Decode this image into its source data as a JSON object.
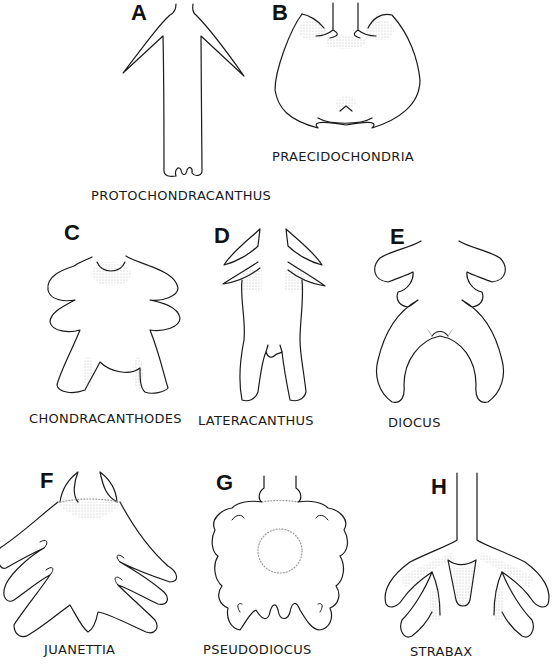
{
  "figure": {
    "panels": [
      {
        "letter": "A",
        "name": "PROTOCHONDRACANTHUS"
      },
      {
        "letter": "B",
        "name": "PRAECIDOCHONDRIA"
      },
      {
        "letter": "C",
        "name": "CHONDRACANTHODES"
      },
      {
        "letter": "D",
        "name": "LATERACANTHUS"
      },
      {
        "letter": "E",
        "name": "DIOCUS"
      },
      {
        "letter": "F",
        "name": "JUANETTIA"
      },
      {
        "letter": "G",
        "name": "PSEUDODIOCUS"
      },
      {
        "letter": "H",
        "name": "STRABAX"
      }
    ],
    "caption_truncated": true
  },
  "colors": {
    "line": "#1a1a1a",
    "stipple": "#8a8a8a",
    "background": "#ffffff"
  }
}
